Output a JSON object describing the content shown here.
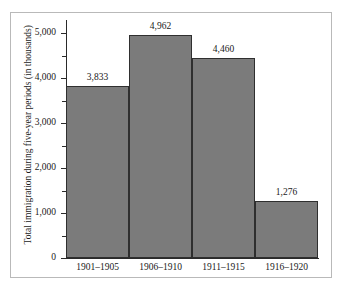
{
  "chart_data": {
    "type": "bar",
    "title": "",
    "xlabel": "",
    "ylabel": "Total immigration during five-year periods (in thousands)",
    "categories": [
      "1901–1905",
      "1906–1910",
      "1911–1915",
      "1916–1920"
    ],
    "values": [
      3833,
      4962,
      4460,
      1276
    ],
    "value_labels": [
      "3,833",
      "4,962",
      "4,460",
      "1,276"
    ],
    "ylim": [
      0,
      5300
    ],
    "ytick_values": [
      0,
      1000,
      2000,
      3000,
      4000,
      5000
    ],
    "ytick_labels": [
      "0",
      "1,000",
      "2,000",
      "3,000",
      "4,000",
      "5,000"
    ],
    "yminor_tick_values": [
      500,
      1500,
      2500,
      3500,
      4500
    ],
    "grid": false,
    "legend": null,
    "bar_color": "#7b7b7b",
    "bar_edge_color": "#2f2f2f",
    "axis_color": "#2a2a2a",
    "frame_color": "#b9b9b9",
    "background": "#ffffff"
  }
}
